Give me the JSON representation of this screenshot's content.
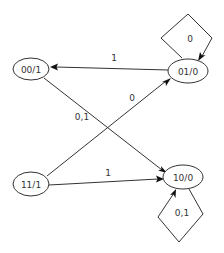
{
  "diagram": {
    "type": "state-machine",
    "states": [
      {
        "id": "s00",
        "label": "00/1"
      },
      {
        "id": "s01",
        "label": "01/0"
      },
      {
        "id": "s11",
        "label": "11/1"
      },
      {
        "id": "s10",
        "label": "10/0"
      }
    ],
    "transitions": [
      {
        "from": "s01",
        "to": "s00",
        "label": "1"
      },
      {
        "from": "s01",
        "to": "s01",
        "label": "0"
      },
      {
        "from": "s00",
        "to": "s10",
        "label": "0,1"
      },
      {
        "from": "s11",
        "to": "s01",
        "label": "0"
      },
      {
        "from": "s11",
        "to": "s10",
        "label": "1"
      },
      {
        "from": "s10",
        "to": "s10",
        "label": "0,1"
      }
    ]
  }
}
